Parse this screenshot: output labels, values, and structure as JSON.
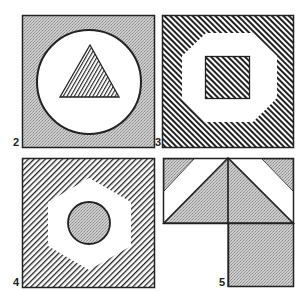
{
  "figure": {
    "colors": {
      "ink": "#222222",
      "stipple_base": "#c9c9c9",
      "stipple_dot": "#8a8a8a",
      "paper": "#ffffff"
    },
    "panels": [
      {
        "id": "2",
        "label": "2",
        "description": "Stippled square containing a white circle with a hatched triangle",
        "background": "stipple",
        "shapes": [
          "circle (white)",
          "triangle (hatched /)"
        ]
      },
      {
        "id": "3",
        "label": "3",
        "description": "Hatched square containing a white octagon with a hatched square",
        "background": "hatch-backslash",
        "shapes": [
          "octagon (white)",
          "square (hatched \\)"
        ]
      },
      {
        "id": "4",
        "label": "4",
        "description": "Hatched square containing a white hexagon with a stippled circle",
        "background": "hatch-slash",
        "shapes": [
          "hexagon (white)",
          "circle (stippled)"
        ]
      },
      {
        "id": "5",
        "label": "5",
        "description": "Rectangle with white diagonal bands and stippled triangles above a stippled square",
        "background": "white",
        "shapes": [
          "corner triangles (stippled)",
          "central triangle (stippled)",
          "square (stippled)"
        ]
      }
    ]
  }
}
